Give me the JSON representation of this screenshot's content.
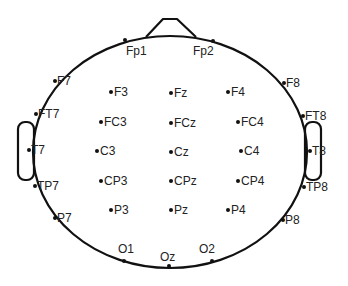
{
  "diagram": {
    "colors": {
      "stroke": "#111111",
      "text": "#222222",
      "background": "#ffffff"
    },
    "head": {
      "cx": 170,
      "cy": 152,
      "rx": 137,
      "ry": 116
    },
    "nose": {
      "points": "146,37 163,19 177,19 196,37"
    },
    "ears": [
      {
        "side": "left",
        "x": 18,
        "y": 122,
        "w": 16,
        "h": 58
      },
      {
        "side": "right",
        "x": 305,
        "y": 122,
        "w": 16,
        "h": 58
      }
    ],
    "electrodes": [
      {
        "name": "Fp1",
        "x": 125,
        "y": 40,
        "lx": 126,
        "ly": 55,
        "anchor": "start"
      },
      {
        "name": "Fp2",
        "x": 213,
        "y": 41,
        "lx": 193,
        "ly": 55,
        "anchor": "start"
      },
      {
        "name": "F7",
        "x": 55,
        "y": 81,
        "lx": 57,
        "ly": 85,
        "anchor": "start"
      },
      {
        "name": "F8",
        "x": 284,
        "y": 83,
        "lx": 286,
        "ly": 87,
        "anchor": "start"
      },
      {
        "name": "FT7",
        "x": 36,
        "y": 114,
        "lx": 38,
        "ly": 118,
        "anchor": "start"
      },
      {
        "name": "FT8",
        "x": 303,
        "y": 116,
        "lx": 305,
        "ly": 120,
        "anchor": "start"
      },
      {
        "name": "T7",
        "x": 29,
        "y": 150,
        "lx": 31,
        "ly": 154,
        "anchor": "start"
      },
      {
        "name": "T8",
        "x": 310,
        "y": 151,
        "lx": 312,
        "ly": 155,
        "anchor": "start"
      },
      {
        "name": "TP7",
        "x": 35,
        "y": 186,
        "lx": 37,
        "ly": 190,
        "anchor": "start"
      },
      {
        "name": "TP8",
        "x": 304,
        "y": 187,
        "lx": 306,
        "ly": 191,
        "anchor": "start"
      },
      {
        "name": "P7",
        "x": 55,
        "y": 218,
        "lx": 57,
        "ly": 222,
        "anchor": "start"
      },
      {
        "name": "P8",
        "x": 283,
        "y": 220,
        "lx": 285,
        "ly": 224,
        "anchor": "start"
      },
      {
        "name": "O1",
        "x": 124,
        "y": 261,
        "lx": 118,
        "ly": 253,
        "anchor": "start"
      },
      {
        "name": "Oz",
        "x": 169,
        "y": 266,
        "lx": 160,
        "ly": 261,
        "anchor": "start"
      },
      {
        "name": "O2",
        "x": 212,
        "y": 261,
        "lx": 199,
        "ly": 253,
        "anchor": "start"
      },
      {
        "name": "F3",
        "x": 111,
        "y": 92,
        "lx": 114,
        "ly": 96,
        "anchor": "start"
      },
      {
        "name": "Fz",
        "x": 171,
        "y": 93,
        "lx": 174,
        "ly": 97,
        "anchor": "start"
      },
      {
        "name": "F4",
        "x": 228,
        "y": 92,
        "lx": 231,
        "ly": 96,
        "anchor": "start"
      },
      {
        "name": "FC3",
        "x": 101,
        "y": 122,
        "lx": 104,
        "ly": 126,
        "anchor": "start"
      },
      {
        "name": "FCz",
        "x": 171,
        "y": 123,
        "lx": 174,
        "ly": 127,
        "anchor": "start"
      },
      {
        "name": "FC4",
        "x": 238,
        "y": 122,
        "lx": 241,
        "ly": 126,
        "anchor": "start"
      },
      {
        "name": "C3",
        "x": 97,
        "y": 151,
        "lx": 100,
        "ly": 155,
        "anchor": "start"
      },
      {
        "name": "Cz",
        "x": 171,
        "y": 152,
        "lx": 174,
        "ly": 156,
        "anchor": "start"
      },
      {
        "name": "C4",
        "x": 241,
        "y": 151,
        "lx": 244,
        "ly": 155,
        "anchor": "start"
      },
      {
        "name": "CP3",
        "x": 101,
        "y": 181,
        "lx": 104,
        "ly": 185,
        "anchor": "start"
      },
      {
        "name": "CPz",
        "x": 171,
        "y": 181,
        "lx": 174,
        "ly": 185,
        "anchor": "start"
      },
      {
        "name": "CP4",
        "x": 238,
        "y": 181,
        "lx": 241,
        "ly": 185,
        "anchor": "start"
      },
      {
        "name": "P3",
        "x": 111,
        "y": 210,
        "lx": 114,
        "ly": 214,
        "anchor": "start"
      },
      {
        "name": "Pz",
        "x": 171,
        "y": 210,
        "lx": 174,
        "ly": 214,
        "anchor": "start"
      },
      {
        "name": "P4",
        "x": 228,
        "y": 210,
        "lx": 231,
        "ly": 214,
        "anchor": "start"
      }
    ]
  }
}
